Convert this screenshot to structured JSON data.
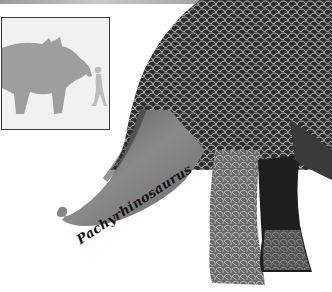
{
  "illustration": {
    "subject": "dinosaur-hindquarters-and-tail",
    "skin_color": "#3a3a3a",
    "skin_pattern_color": "#c8c8c8"
  },
  "scale_inset": {
    "dinosaur_silhouette_color": "#9e9e9e",
    "human_silhouette_color": "#bdbdbd",
    "background_color": "#f1f1f1",
    "border_color": "#3a3a3a"
  },
  "caption": {
    "text": "Pachyrhinosaurus"
  }
}
